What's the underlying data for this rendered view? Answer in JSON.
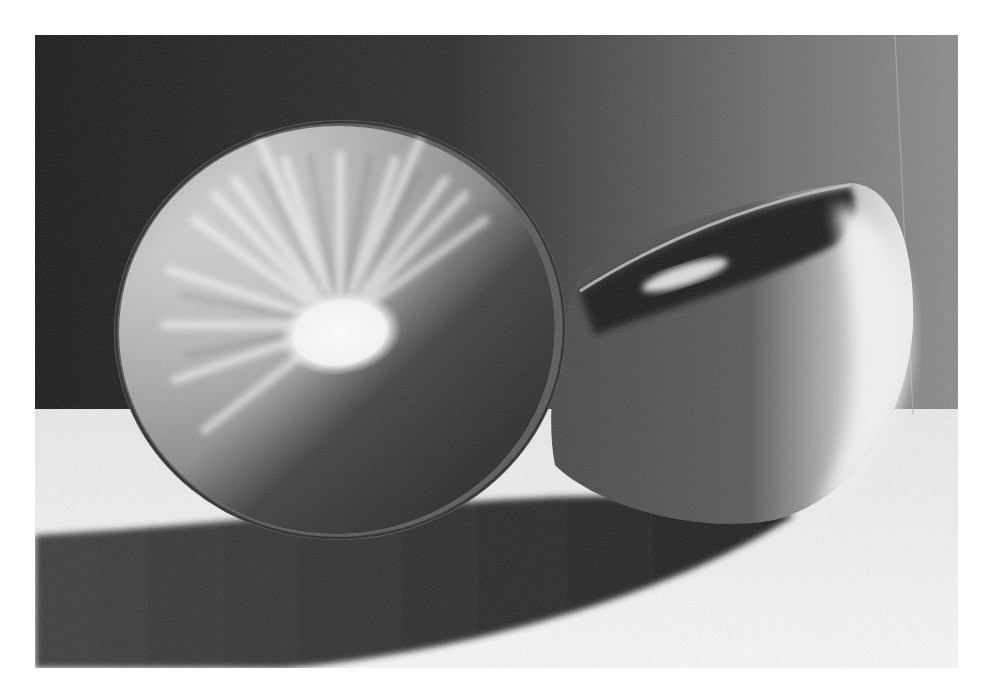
{
  "photo": {
    "subject": "kiwi fruit cut in half",
    "style": "black-and-white photograph",
    "colors": {
      "page_background": "#ffffff",
      "backdrop_dark": "#1e1e1e",
      "backdrop_light": "#8a8a8a",
      "table_surface": "#f2f2f2",
      "shadow": "#3a3a3a",
      "flesh_light": "#e6e6e6",
      "flesh_dark": "#3c3c3c",
      "core": "#fbfbfb",
      "skin": "#555555"
    }
  }
}
